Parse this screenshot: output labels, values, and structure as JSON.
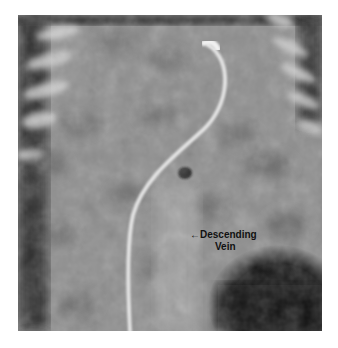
{
  "figure": {
    "kind": "radiograph",
    "annotation": {
      "arrow": "←",
      "line1": "Descending",
      "line2": "Vein"
    }
  }
}
